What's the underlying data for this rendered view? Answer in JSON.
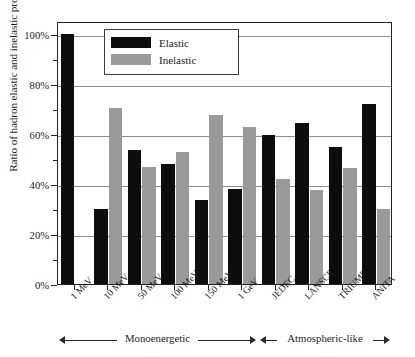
{
  "chart_data": {
    "type": "bar",
    "title": "",
    "xlabel": "",
    "ylabel": "Ratio of hadron elastic and inelastic processes",
    "ylim": [
      0,
      100
    ],
    "ytick_labels": [
      "0%",
      "20%",
      "40%",
      "60%",
      "80%",
      "100%"
    ],
    "ytick_values": [
      0,
      20,
      40,
      60,
      80,
      100
    ],
    "yminor_values": [
      10,
      30,
      50,
      70,
      90
    ],
    "grid": "horizontal major gridlines",
    "legend_position": "upper left inside axes",
    "categories": [
      "1 MeV",
      "10 MeV",
      "50 MeV",
      "100 MeV",
      "150 MeV",
      "1 GeV",
      "JEDEC",
      "LANSCE",
      "TRIUMF",
      "ANITA"
    ],
    "series": [
      {
        "name": "Elastic",
        "color": "#0d0d0d",
        "values": [
          100,
          30,
          53.5,
          48,
          33.5,
          38,
          59.5,
          64.5,
          55,
          72
        ]
      },
      {
        "name": "Inelastic",
        "color": "#9a9a9a",
        "values": [
          null,
          70.5,
          47,
          53,
          67.5,
          63,
          42,
          37.5,
          46.5,
          30
        ]
      }
    ],
    "annotations": [
      {
        "label": "Monoenergetic",
        "spans_categories": [
          "1 MeV",
          "1 GeV"
        ],
        "style": "double-headed-arrow"
      },
      {
        "label": "Atmospheric-like",
        "spans_categories": [
          "JEDEC",
          "ANITA"
        ],
        "style": "double-headed-arrow"
      }
    ]
  },
  "legend": {
    "items": [
      {
        "label": "Elastic",
        "color": "#0d0d0d"
      },
      {
        "label": "Inelastic",
        "color": "#9a9a9a"
      }
    ]
  }
}
